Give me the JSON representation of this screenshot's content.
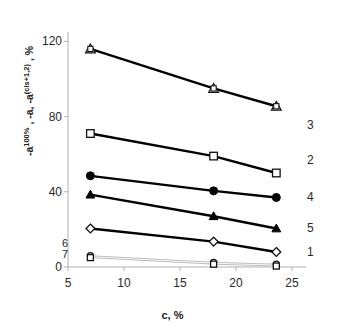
{
  "chart_data": {
    "type": "line",
    "title": "",
    "xlabel": "c, %",
    "ylabel": "-a^100% , -a, -a^(cis+1,2) , %",
    "ylabel_parts": {
      "p1": "-a",
      "p1_sup": "100%",
      "p2": " , -a, -a",
      "p2_sup": "(cis+1,2)",
      "p3": " , %"
    },
    "xlim": [
      5,
      25
    ],
    "ylim": [
      0,
      125
    ],
    "xticks": [
      5,
      10,
      15,
      20,
      25
    ],
    "yticks": [
      0,
      40,
      80,
      120
    ],
    "xtick_labels": [
      "5",
      "10",
      "15",
      "20",
      "25"
    ],
    "ytick_labels": [
      "0",
      "40",
      "80",
      "120"
    ],
    "grid": false,
    "legend_position": "right-inline-labels",
    "x": [
      7.0,
      18.0,
      23.6
    ],
    "series": [
      {
        "name": "1",
        "label": "1",
        "marker": "open-diamond",
        "color": "#000000",
        "values": [
          20.5,
          13.5,
          8.0
        ]
      },
      {
        "name": "2",
        "label": "2",
        "marker": "open-square",
        "color": "#000000",
        "values": [
          71.0,
          59.0,
          50.0
        ]
      },
      {
        "name": "3",
        "label": "3",
        "marker": "open-triangle",
        "color": "#000000",
        "values": [
          116.0,
          95.0,
          85.5
        ]
      },
      {
        "name": "4",
        "label": "4",
        "marker": "filled-circle",
        "color": "#000000",
        "values": [
          48.5,
          40.5,
          37.0
        ]
      },
      {
        "name": "5",
        "label": "5",
        "marker": "filled-triangle",
        "color": "#000000",
        "values": [
          38.5,
          27.0,
          20.5
        ]
      },
      {
        "name": "6",
        "label": "6",
        "marker": "open-circle",
        "color": "#bdbdbd",
        "values": [
          6.0,
          2.5,
          1.5
        ]
      },
      {
        "name": "7",
        "label": "7",
        "marker": "open-square",
        "color": "#bdbdbd",
        "values": [
          5.0,
          1.5,
          0.5
        ]
      }
    ]
  },
  "axis_colors": {
    "axis_line": "#b0b0b0",
    "tick_text": "#2a2a2a",
    "data_dark": "#000000",
    "data_faint": "#bdbdbd"
  }
}
